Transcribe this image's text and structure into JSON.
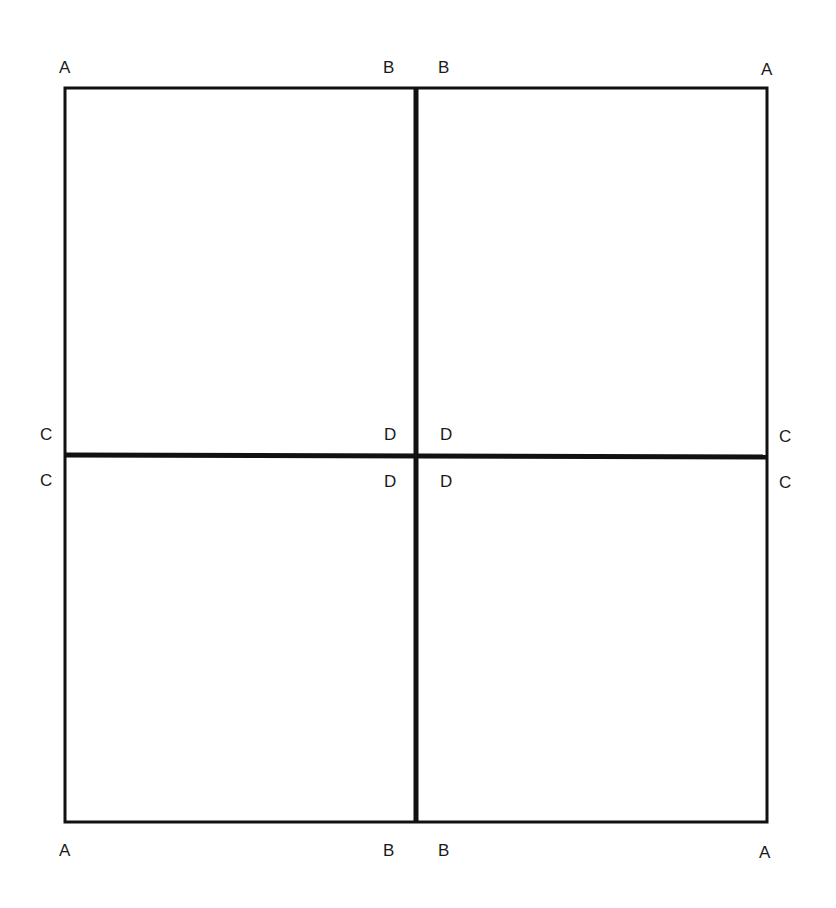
{
  "diagram": {
    "stroke_color": "#111111",
    "labels": {
      "top_left": "A",
      "top_mid_left": "B",
      "top_mid_right": "B",
      "top_right": "A",
      "mid_left_upper": "C",
      "center_upper_left": "D",
      "center_upper_right": "D",
      "mid_right_upper": "C",
      "mid_left_lower": "C",
      "center_lower_left": "D",
      "center_lower_right": "D",
      "mid_right_lower": "C",
      "bottom_left": "A",
      "bottom_mid_left": "B",
      "bottom_mid_right": "B",
      "bottom_right": "A"
    }
  }
}
